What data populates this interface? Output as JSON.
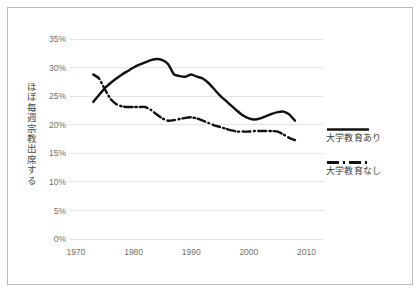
{
  "chart_data": {
    "type": "line",
    "title": "",
    "xlabel": "",
    "ylabel": "ほぼ毎週宗教出席する",
    "xlim": [
      1970,
      2012
    ],
    "ylim": [
      0,
      35
    ],
    "grid": true,
    "legend_position": "right",
    "x_ticks": [
      "1970",
      "1980",
      "1990",
      "2000",
      "2010"
    ],
    "x_tick_values": [
      1970,
      1980,
      1990,
      2000,
      2010
    ],
    "y_ticks": [
      "0%",
      "5%",
      "10%",
      "15%",
      "20%",
      "25%",
      "30%",
      "35%"
    ],
    "y_tick_values": [
      0,
      5,
      10,
      15,
      20,
      25,
      30,
      35
    ],
    "series": [
      {
        "name": "大学教育あり",
        "style": "solid",
        "color": "#111111",
        "x": [
          1973,
          1974,
          1975,
          1976,
          1977,
          1978,
          1979,
          1980,
          1981,
          1982,
          1983,
          1984,
          1985,
          1986,
          1987,
          1988,
          1989,
          1990,
          1991,
          1992,
          1993,
          1994,
          1995,
          1996,
          1997,
          1998,
          1999,
          2000,
          2001,
          2002,
          2003,
          2004,
          2005,
          2006,
          2007,
          2008
        ],
        "values": [
          24.0,
          25.2,
          26.4,
          27.3,
          28.1,
          28.8,
          29.4,
          30.0,
          30.5,
          30.9,
          31.3,
          31.5,
          31.3,
          30.6,
          28.8,
          28.5,
          28.4,
          28.8,
          28.4,
          28.1,
          27.3,
          26.2,
          25.1,
          24.2,
          23.3,
          22.4,
          21.6,
          21.1,
          20.9,
          21.1,
          21.5,
          21.9,
          22.2,
          22.3,
          21.8,
          20.7
        ]
      },
      {
        "name": "大学教育なし",
        "style": "dash-dot",
        "color": "#111111",
        "x": [
          1973,
          1974,
          1975,
          1976,
          1977,
          1978,
          1979,
          1980,
          1981,
          1982,
          1983,
          1984,
          1985,
          1986,
          1987,
          1988,
          1989,
          1990,
          1991,
          1992,
          1993,
          1994,
          1995,
          1996,
          1997,
          1998,
          1999,
          2000,
          2001,
          2002,
          2003,
          2004,
          2005,
          2006,
          2007,
          2008
        ],
        "values": [
          28.8,
          28.1,
          26.2,
          24.5,
          23.6,
          23.2,
          23.1,
          23.1,
          23.1,
          23.1,
          22.6,
          21.8,
          21.1,
          20.7,
          20.8,
          21.0,
          21.2,
          21.3,
          21.1,
          20.7,
          20.3,
          19.9,
          19.6,
          19.3,
          19.0,
          18.8,
          18.8,
          18.8,
          18.9,
          18.9,
          18.9,
          18.9,
          18.8,
          18.3,
          17.7,
          17.3
        ]
      }
    ]
  },
  "legend": {
    "entries": [
      {
        "label": "大学教育あり",
        "style": "solid"
      },
      {
        "label": "大学教育なし",
        "style": "dash-dot"
      }
    ]
  },
  "colors": {
    "series": "#111111",
    "gridline": "#e4e4e4",
    "tick_text": "#6f6f6f",
    "frame_border": "#b9b9b9",
    "background": "#ffffff"
  }
}
